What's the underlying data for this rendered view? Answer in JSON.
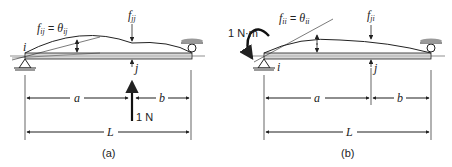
{
  "diagram": {
    "type": "structural-beam-influence",
    "panels": [
      {
        "caption": "(a)",
        "load_label": "1 N",
        "slope_label": {
          "f": "f",
          "f_sub": "ij",
          "eq": "=",
          "theta": "θ",
          "theta_sub": "ij"
        },
        "deflection_label": {
          "f": "f",
          "f_sub": "jj"
        },
        "point_i": "i",
        "point_j": "j",
        "dim_a": "a",
        "dim_b": "b",
        "dim_L": "L"
      },
      {
        "caption": "(b)",
        "moment_label": "1 N·m",
        "slope_label": {
          "f": "f",
          "f_sub": "ii",
          "eq": "=",
          "theta": "θ",
          "theta_sub": "ii"
        },
        "deflection_label": {
          "f": "f",
          "f_sub": "ji"
        },
        "point_i": "i",
        "point_j": "j",
        "dim_a": "a",
        "dim_b": "b",
        "dim_L": "L"
      }
    ],
    "colors": {
      "line": "#222222",
      "beam_fill": "#d8d8d8",
      "support_fill": "#9a9a9a"
    }
  }
}
